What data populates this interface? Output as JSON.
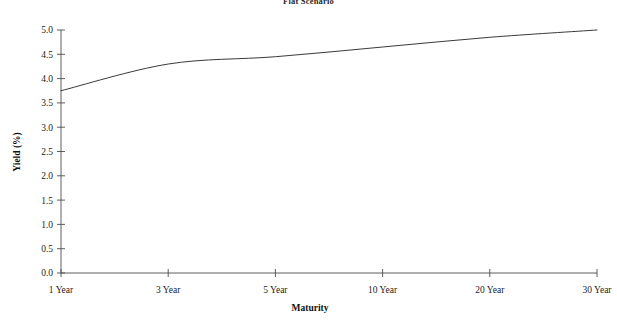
{
  "chart_data": {
    "type": "line",
    "title": "Flat Scenario",
    "xlabel": "Maturity",
    "ylabel": "Yield (%)",
    "categories": [
      "1 Year",
      "3 Year",
      "5 Year",
      "10 Year",
      "20 Year",
      "30 Year"
    ],
    "series": [
      {
        "name": "Flat Scenario",
        "color": "#3a3a3a",
        "values": [
          3.75,
          4.3,
          4.45,
          4.65,
          4.85,
          5.0
        ]
      }
    ],
    "ylim": [
      0.0,
      5.0
    ],
    "ytick_labels": [
      "0.0",
      "0.5",
      "1.0",
      "1.5",
      "2.0",
      "2.5",
      "3.0",
      "3.5",
      "4.0",
      "4.5",
      "5.0"
    ],
    "ytick_values": [
      0.0,
      0.5,
      1.0,
      1.5,
      2.0,
      2.5,
      3.0,
      3.5,
      4.0,
      4.5,
      5.0
    ],
    "grid": false,
    "legend": "none",
    "axis_color": "#4d4d4d",
    "background": "#ffffff"
  }
}
